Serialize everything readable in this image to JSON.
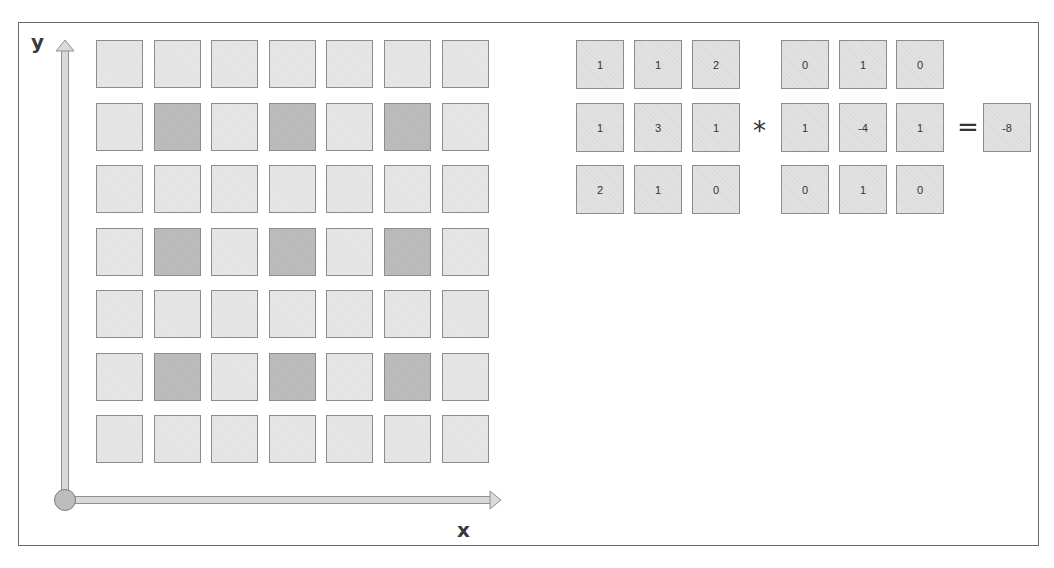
{
  "axes": {
    "y_label": "y",
    "x_label": "x"
  },
  "grid": {
    "rows": 7,
    "cols": 7,
    "colors": {
      "light": "#e6e6e6",
      "dark": "#bcbcbc",
      "border": "#8c8c8c"
    },
    "dark_cells": [
      [
        1,
        1
      ],
      [
        1,
        3
      ],
      [
        1,
        5
      ],
      [
        3,
        1
      ],
      [
        3,
        3
      ],
      [
        3,
        5
      ],
      [
        5,
        1
      ],
      [
        5,
        3
      ],
      [
        5,
        5
      ]
    ]
  },
  "equation": {
    "input_patch": [
      [
        "1",
        "1",
        "2"
      ],
      [
        "1",
        "3",
        "1"
      ],
      [
        "2",
        "1",
        "0"
      ]
    ],
    "operator": "*",
    "kernel": [
      [
        "0",
        "1",
        "0"
      ],
      [
        "1",
        "-4",
        "1"
      ],
      [
        "0",
        "1",
        "0"
      ]
    ],
    "equals": "=",
    "result": "-8"
  }
}
